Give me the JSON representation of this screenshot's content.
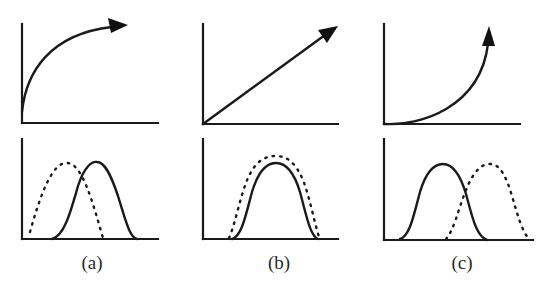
{
  "figure": {
    "panels": [
      {
        "label": "(a)",
        "top_curve": "concave (decelerating) rise with arrow",
        "bottom": {
          "dotted_curve": "bell shifted left",
          "solid_curve": "bell shifted right"
        }
      },
      {
        "label": "(b)",
        "top_curve": "straight diagonal line with arrow",
        "bottom": {
          "dotted_curve": "bell overlapping, slightly taller",
          "solid_curve": "bell centered"
        }
      },
      {
        "label": "(c)",
        "top_curve": "convex (accelerating) rise with arrow",
        "bottom": {
          "dotted_curve": "bell shifted right",
          "solid_curve": "bell shifted left"
        }
      }
    ]
  },
  "colors": {
    "ink": "#1a1a1a",
    "background": "#ffffff"
  }
}
